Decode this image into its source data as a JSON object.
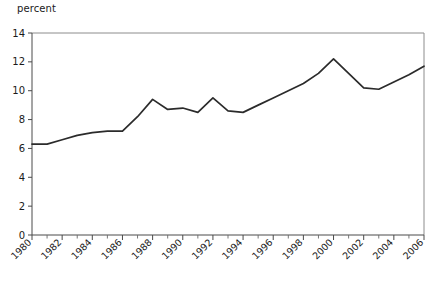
{
  "chart_data": {
    "type": "line",
    "title": "",
    "subtitle": "",
    "xlabel": "",
    "ylabel": "percent",
    "ylabel_position": "top-left",
    "xlim": [
      1980,
      2006
    ],
    "ylim": [
      0,
      14
    ],
    "y_ticks": [
      0,
      2,
      4,
      6,
      8,
      10,
      12,
      14
    ],
    "y_tick_labels": [
      "0",
      "2",
      "4",
      "6",
      "8",
      "10",
      "12",
      "14"
    ],
    "x_ticks": [
      1980,
      1982,
      1984,
      1986,
      1988,
      1990,
      1992,
      1994,
      1996,
      1998,
      2000,
      2002,
      2004,
      2006
    ],
    "x_tick_labels": [
      "1980",
      "1982",
      "1984",
      "1986",
      "1988",
      "1990",
      "1992",
      "1994",
      "1996",
      "1998",
      "2000",
      "2002",
      "2004",
      "2006"
    ],
    "x_minor_ticks": [
      1981,
      1983,
      1985,
      1987,
      1989,
      1991,
      1993,
      1995,
      1997,
      1999,
      2001,
      2003,
      2005
    ],
    "x_tick_label_rotation": 45,
    "grid": false,
    "legend": false,
    "legend_position": "none",
    "line_color": "#2b2b2b",
    "x": [
      1980,
      1981,
      1982,
      1983,
      1984,
      1985,
      1986,
      1987,
      1988,
      1989,
      1990,
      1991,
      1992,
      1993,
      1994,
      1995,
      1996,
      1997,
      1998,
      1999,
      2000,
      2001,
      2002,
      2003,
      2004,
      2005,
      2006
    ],
    "values": [
      6.3,
      6.3,
      6.6,
      6.9,
      7.1,
      7.2,
      7.2,
      8.2,
      9.4,
      8.7,
      8.8,
      8.5,
      9.5,
      8.6,
      8.5,
      9.0,
      9.5,
      10.0,
      10.5,
      11.2,
      12.2,
      11.2,
      10.2,
      10.1,
      10.6,
      11.1,
      11.7
    ],
    "series": [
      {
        "name": "percent",
        "values": [
          6.3,
          6.3,
          6.6,
          6.9,
          7.1,
          7.2,
          7.2,
          8.2,
          9.4,
          8.7,
          8.8,
          8.5,
          9.5,
          8.6,
          8.5,
          9.0,
          9.5,
          10.0,
          10.5,
          11.2,
          12.2,
          11.2,
          10.2,
          10.1,
          10.6,
          11.1,
          11.7
        ]
      }
    ],
    "annotations": []
  }
}
